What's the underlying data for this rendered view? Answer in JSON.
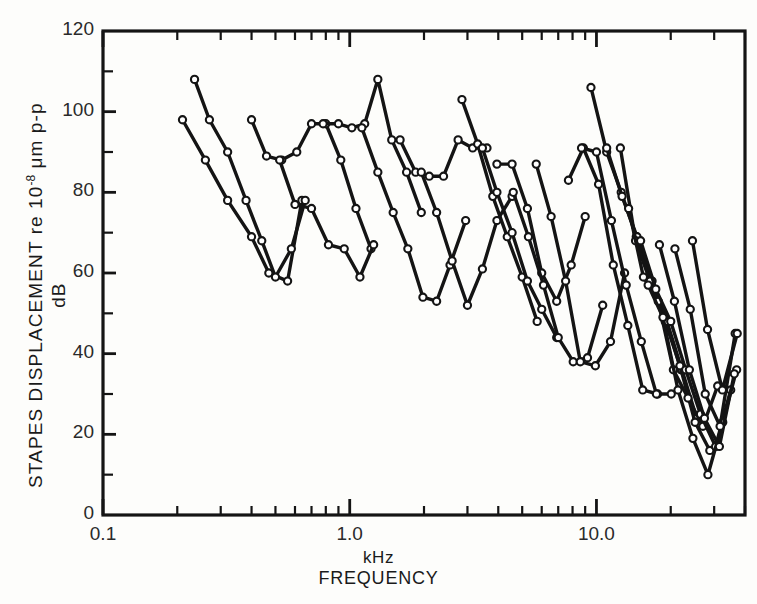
{
  "figure": {
    "background_color": "#fdfdfb",
    "ink_color": "#141414",
    "marker_fill": "#ffffff"
  },
  "axes": {
    "y_title_main": "STAPES DISPLACEMENT  re 10",
    "y_title_exponent": "-8",
    "y_title_tail": " μm p-p",
    "y_title_sub": "dB",
    "x_title_unit": "kHz",
    "x_title_name": "FREQUENCY",
    "y_tick_labels": [
      "0",
      "20",
      "40",
      "60",
      "80",
      "100",
      "120"
    ],
    "y_tick_values": [
      0,
      20,
      40,
      60,
      80,
      100,
      120
    ],
    "y_minor_values": [
      10,
      30,
      50,
      70,
      90,
      110
    ],
    "x_tick_labels": [
      "0.1",
      "1.0",
      "10.0"
    ],
    "x_tick_values": [
      0.1,
      1.0,
      10.0
    ],
    "frame": {
      "left": 103,
      "top": 31,
      "right": 745,
      "bottom": 515
    }
  },
  "chart_data": {
    "type": "line",
    "title": "",
    "xlabel": "FREQUENCY (kHz)",
    "ylabel": "STAPES DISPLACEMENT re 10-8 μm p-p (dB)",
    "xscale": "log",
    "yscale": "linear",
    "xlim": [
      0.1,
      40.0
    ],
    "ylim": [
      0,
      120
    ],
    "grid": false,
    "legend": false,
    "marker": "open-circle",
    "x_major_ticks": [
      0.1,
      1.0,
      10.0
    ],
    "x_minor_ticks": [
      0.2,
      0.3,
      0.4,
      0.5,
      0.6,
      0.7,
      0.8,
      0.9,
      2,
      3,
      4,
      5,
      6,
      7,
      8,
      9,
      20,
      30,
      40
    ],
    "y_major_ticks": [
      0,
      20,
      40,
      60,
      80,
      100,
      120
    ],
    "y_minor_ticks": [
      10,
      30,
      50,
      70,
      90,
      110
    ],
    "series": [
      {
        "name": "curve-1",
        "x": [
          0.21,
          0.26,
          0.32,
          0.4,
          0.47,
          0.56,
          0.64
        ],
        "y": [
          98,
          88,
          78,
          69,
          60,
          58,
          78
        ]
      },
      {
        "name": "curve-2",
        "x": [
          0.235,
          0.27,
          0.32,
          0.38,
          0.44,
          0.5,
          0.58,
          0.66
        ],
        "y": [
          108,
          98,
          90,
          78,
          68,
          59,
          66,
          78
        ]
      },
      {
        "name": "curve-3",
        "x": [
          0.4,
          0.46,
          0.53,
          0.61,
          0.7,
          0.8,
          0.92,
          1.06,
          1.22
        ],
        "y": [
          98,
          89,
          88,
          90,
          97,
          97,
          88,
          76,
          66
        ]
      },
      {
        "name": "curve-4",
        "x": [
          0.52,
          0.6,
          0.7,
          0.82,
          0.95,
          1.1,
          1.25
        ],
        "y": [
          88,
          77,
          76,
          67,
          66,
          59,
          67
        ]
      },
      {
        "name": "curve-5",
        "x": [
          0.78,
          0.9,
          1.02,
          1.15,
          1.3,
          1.48,
          1.7,
          1.95
        ],
        "y": [
          97,
          97,
          96,
          97,
          108,
          93,
          85,
          75
        ]
      },
      {
        "name": "curve-6",
        "x": [
          1.12,
          1.3,
          1.5,
          1.72,
          1.98,
          2.25,
          2.55,
          2.95
        ],
        "y": [
          96,
          85,
          75,
          66,
          54,
          53,
          62,
          73
        ]
      },
      {
        "name": "curve-7",
        "x": [
          1.6,
          1.85,
          2.1,
          2.4,
          2.75,
          3.15,
          3.6
        ],
        "y": [
          93,
          85,
          84,
          84,
          93,
          91,
          91
        ]
      },
      {
        "name": "curve-8",
        "x": [
          1.95,
          2.25,
          2.6,
          3.0,
          3.45,
          3.95,
          4.55
        ],
        "y": [
          85,
          75,
          63,
          52,
          61,
          73,
          79
        ]
      },
      {
        "name": "curve-9",
        "x": [
          2.85,
          3.3,
          3.8,
          4.35,
          5.0,
          5.75
        ],
        "y": [
          103,
          92,
          79,
          69,
          59,
          48
        ]
      },
      {
        "name": "curve-10",
        "x": [
          3.45,
          3.95,
          4.55,
          5.25,
          6.0,
          6.9
        ],
        "y": [
          91,
          80,
          70,
          58,
          51,
          44
        ]
      },
      {
        "name": "curve-11",
        "x": [
          3.95,
          4.55,
          5.25,
          6.0,
          6.9,
          7.9,
          9.0
        ],
        "y": [
          87,
          87,
          76,
          60,
          53,
          62,
          74
        ]
      },
      {
        "name": "curve-12",
        "x": [
          4.6,
          5.3,
          6.1,
          7.0,
          8.05,
          9.2,
          10.6
        ],
        "y": [
          80,
          69,
          57,
          44,
          38,
          39,
          52
        ]
      },
      {
        "name": "curve-13",
        "x": [
          5.7,
          6.55,
          7.5,
          8.6,
          9.9,
          11.4,
          13.0
        ],
        "y": [
          87,
          74,
          58,
          38,
          37,
          43,
          60
        ]
      },
      {
        "name": "curve-14",
        "x": [
          7.7,
          8.85,
          10.2,
          11.7,
          13.4,
          15.4,
          17.7
        ],
        "y": [
          83,
          91,
          82,
          62,
          47,
          31,
          30
        ]
      },
      {
        "name": "curve-15",
        "x": [
          8.7,
          10.0,
          11.5,
          13.2,
          15.2,
          17.5,
          20.1
        ],
        "y": [
          91,
          90,
          73,
          57,
          43,
          30,
          30
        ]
      },
      {
        "name": "curve-16",
        "x": [
          9.5,
          11.0,
          12.6,
          14.5,
          16.7,
          19.2,
          22.0
        ],
        "y": [
          106,
          90,
          80,
          69,
          58,
          48,
          36
        ]
      },
      {
        "name": "curve-17",
        "x": [
          11.0,
          12.7,
          14.6,
          16.8,
          19.3,
          22.2,
          25.5
        ],
        "y": [
          91,
          79,
          69,
          58,
          48,
          36,
          24
        ]
      },
      {
        "name": "curve-18",
        "x": [
          12.5,
          14.4,
          16.5,
          19.0,
          21.8,
          25.1,
          28.8
        ],
        "y": [
          91,
          68,
          58,
          48,
          37,
          23,
          16
        ]
      },
      {
        "name": "curve-19",
        "x": [
          13.5,
          15.5,
          17.8,
          20.5,
          23.5,
          27.0,
          31.0
        ],
        "y": [
          76,
          59,
          53,
          36,
          29,
          22,
          32
        ]
      },
      {
        "name": "curve-20",
        "x": [
          15.1,
          17.4,
          20.0,
          23.0,
          26.4,
          30.4,
          35.0
        ],
        "y": [
          68,
          56,
          48,
          36,
          25,
          17,
          31
        ]
      },
      {
        "name": "curve-21",
        "x": [
          16.2,
          18.6,
          21.4,
          24.6,
          28.3,
          32.5,
          37.0
        ],
        "y": [
          57,
          49,
          31,
          19,
          10,
          23,
          36
        ]
      },
      {
        "name": "curve-22",
        "x": [
          18.0,
          20.7,
          23.8,
          27.4,
          31.5,
          36.2
        ],
        "y": [
          67,
          53,
          36,
          24,
          17,
          35
        ]
      },
      {
        "name": "curve-23",
        "x": [
          20.8,
          24.0,
          27.6,
          31.7,
          36.5
        ],
        "y": [
          66,
          51,
          30,
          22,
          45
        ]
      },
      {
        "name": "curve-24",
        "x": [
          24.5,
          28.2,
          32.4,
          37.2
        ],
        "y": [
          68,
          46,
          31,
          45
        ]
      }
    ]
  }
}
